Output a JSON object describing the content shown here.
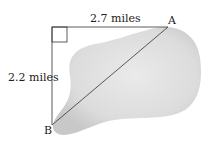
{
  "diagram": {
    "labels": {
      "top_distance": "2.7 miles",
      "left_distance": "2.2 miles",
      "point_a": "A",
      "point_b": "B"
    },
    "colors": {
      "lake_fill": "#d9d9d9",
      "line": "#333333"
    }
  }
}
